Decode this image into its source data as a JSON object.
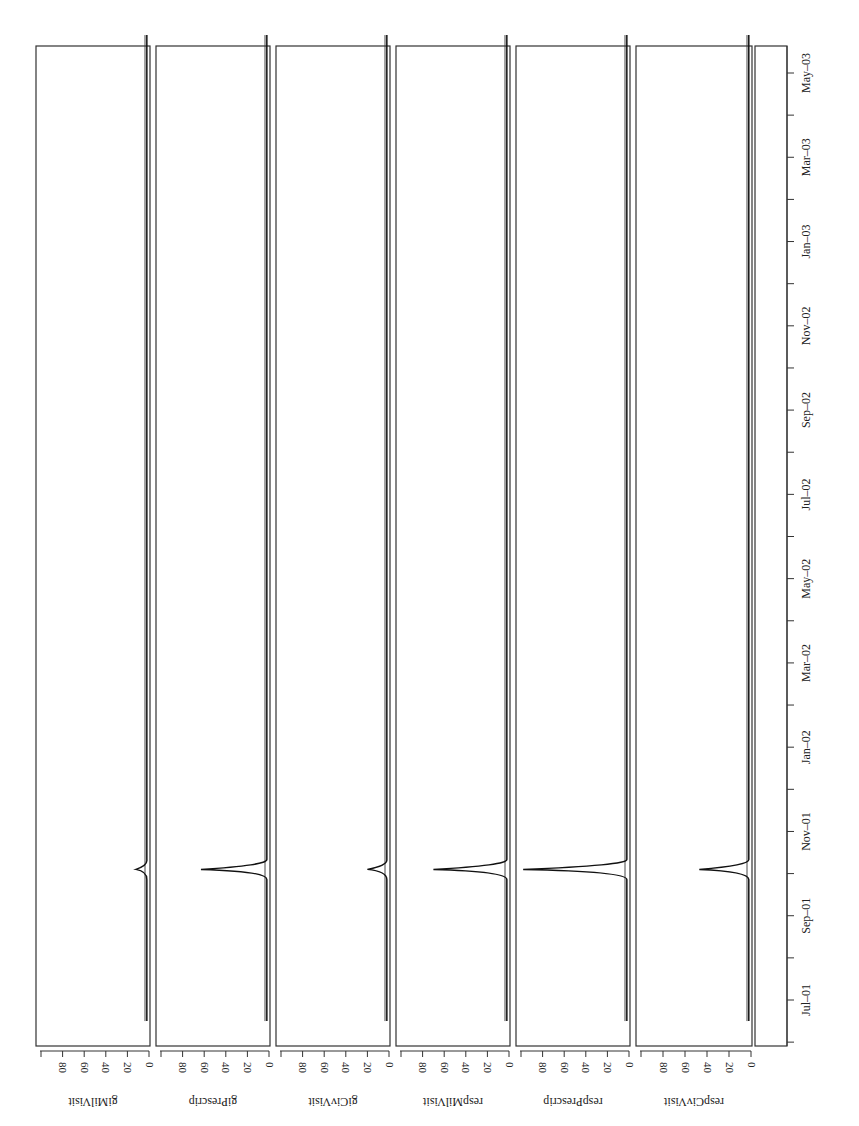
{
  "chart_data": {
    "type": "line",
    "orientation": "rotated-90-clockwise",
    "title": "",
    "xlabel": "",
    "time_ticks": [
      "Jul-01",
      "Sep-01",
      "Nov-01",
      "Jan-02",
      "Mar-02",
      "May-02",
      "Jul-02",
      "Sep-02",
      "Nov-02",
      "Jan-03",
      "Mar-03",
      "May-03"
    ],
    "value_ticks": [
      "0",
      "20",
      "40",
      "60",
      "80"
    ],
    "ylim": [
      0,
      100
    ],
    "series": [
      {
        "name": "giMilVisit",
        "baseline": 2,
        "peak": 12,
        "peak_at": "Oct-01"
      },
      {
        "name": "giPrescrip",
        "baseline": 2,
        "peak": 63,
        "peak_at": "Oct-01"
      },
      {
        "name": "giCivVisit",
        "baseline": 2,
        "peak": 20,
        "peak_at": "Oct-01"
      },
      {
        "name": "respMilVisit",
        "baseline": 2,
        "peak": 70,
        "peak_at": "Oct-01"
      },
      {
        "name": "respPrescrip",
        "baseline": 2,
        "peak": 98,
        "peak_at": "Oct-01"
      },
      {
        "name": "respCivVisit",
        "baseline": 2,
        "peak": 47,
        "peak_at": "Oct-01"
      }
    ]
  }
}
